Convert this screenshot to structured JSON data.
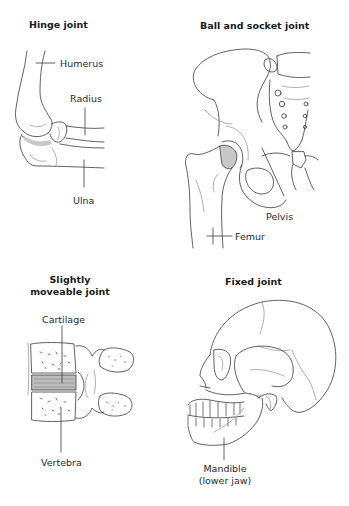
{
  "panels": {
    "hinge": {
      "title": "Hinge joint",
      "labels": {
        "humerus": "Humerus",
        "radius": "Radius",
        "ulna": "Ulna"
      }
    },
    "ball_socket": {
      "title": "Ball and socket joint",
      "labels": {
        "pelvis": "Pelvis",
        "femur": "Femur"
      }
    },
    "slightly_moveable": {
      "title_line1": "Slightly",
      "title_line2": "moveable joint",
      "labels": {
        "cartilage": "Cartilage",
        "vertebra": "Vertebra"
      }
    },
    "fixed": {
      "title": "Fixed joint",
      "labels": {
        "mandible_line1": "Mandible",
        "mandible_line2": "(lower jaw)"
      }
    }
  },
  "colors": {
    "line": "#3a3a3a",
    "faint": "#9a9a9a",
    "cartilage_fill": "#c8c8c8"
  }
}
